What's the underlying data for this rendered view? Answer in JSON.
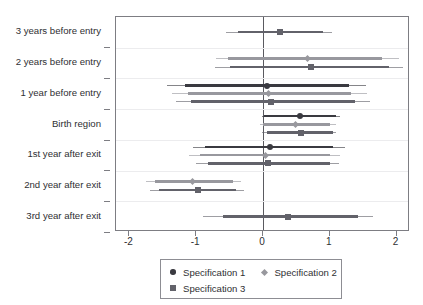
{
  "chart_data": {
    "type": "scatter",
    "subtype": "coefficient-plot-forest",
    "title": "",
    "subtitle": "",
    "xlabel": "",
    "ylabel": "",
    "xlim": [
      -2.2,
      2.2
    ],
    "xticks": [
      -2,
      -1,
      0,
      1,
      2
    ],
    "xticklabels": [
      "-2",
      "-1",
      "0",
      "1",
      "2"
    ],
    "grid": true,
    "grid_axis": "y",
    "zero_reference_line": 0,
    "legend_position": "bottom",
    "categories": [
      "3 years before entry",
      "2 years before entry",
      "1 year before entry",
      "Birth region",
      "1st year after exit",
      "2nd year after exit",
      "3rd year after exit"
    ],
    "series": [
      {
        "name": "Specification 1",
        "marker": "circle",
        "color": "#3a3a40",
        "points": [
          {
            "category": "3 years before entry",
            "estimate": null,
            "ci_low": null,
            "ci_high": null,
            "ci_outer_low": null,
            "ci_outer_high": null
          },
          {
            "category": "2 years before entry",
            "estimate": null,
            "ci_low": null,
            "ci_high": null,
            "ci_outer_low": null,
            "ci_outer_high": null
          },
          {
            "category": "1 year before entry",
            "estimate": 0.06,
            "ci_low": -1.17,
            "ci_high": 1.28,
            "ci_outer_low": -1.43,
            "ci_outer_high": 1.54
          },
          {
            "category": "Birth region",
            "estimate": 0.55,
            "ci_low": 0.02,
            "ci_high": 1.09,
            "ci_outer_low": -0.02,
            "ci_outer_high": 1.15
          },
          {
            "category": "1st year after exit",
            "estimate": 0.1,
            "ci_low": -0.87,
            "ci_high": 1.05,
            "ci_outer_low": -1.05,
            "ci_outer_high": 1.22
          },
          {
            "category": "2nd year after exit",
            "estimate": null,
            "ci_low": null,
            "ci_high": null,
            "ci_outer_low": null,
            "ci_outer_high": null
          },
          {
            "category": "3rd year after exit",
            "estimate": null,
            "ci_low": null,
            "ci_high": null,
            "ci_outer_low": null,
            "ci_outer_high": null
          }
        ]
      },
      {
        "name": "Specification 2",
        "marker": "diamond",
        "color": "#98989e",
        "points": [
          {
            "category": "3 years before entry",
            "estimate": null,
            "ci_low": null,
            "ci_high": null,
            "ci_outer_low": null,
            "ci_outer_high": null
          },
          {
            "category": "2 years before entry",
            "estimate": 0.66,
            "ci_low": -0.52,
            "ci_high": 1.78,
            "ci_outer_low": -0.71,
            "ci_outer_high": 2.04
          },
          {
            "category": "1 year before entry",
            "estimate": 0.08,
            "ci_low": -1.12,
            "ci_high": 1.32,
            "ci_outer_low": -1.36,
            "ci_outer_high": 1.55
          },
          {
            "category": "Birth region",
            "estimate": 0.49,
            "ci_low": 0.0,
            "ci_high": 1.0,
            "ci_outer_low": -0.05,
            "ci_outer_high": 1.09
          },
          {
            "category": "1st year after exit",
            "estimate": 0.04,
            "ci_low": -0.95,
            "ci_high": 1.0,
            "ci_outer_low": -1.11,
            "ci_outer_high": 1.15
          },
          {
            "category": "2nd year after exit",
            "estimate": -1.05,
            "ci_low": -1.62,
            "ci_high": -0.45,
            "ci_outer_low": -1.75,
            "ci_outer_high": -0.33
          },
          {
            "category": "3rd year after exit",
            "estimate": null,
            "ci_low": null,
            "ci_high": null,
            "ci_outer_low": null,
            "ci_outer_high": null
          }
        ]
      },
      {
        "name": "Specification 3",
        "marker": "square",
        "color": "#62626a",
        "points": [
          {
            "category": "3 years before entry",
            "estimate": 0.25,
            "ci_low": -0.37,
            "ci_high": 0.9,
            "ci_outer_low": -0.55,
            "ci_outer_high": 1.04
          },
          {
            "category": "2 years before entry",
            "estimate": 0.72,
            "ci_low": -0.5,
            "ci_high": 1.88,
            "ci_outer_low": -0.72,
            "ci_outer_high": 2.1
          },
          {
            "category": "1 year before entry",
            "estimate": 0.12,
            "ci_low": -1.08,
            "ci_high": 1.38,
            "ci_outer_low": -1.3,
            "ci_outer_high": 1.6
          },
          {
            "category": "Birth region",
            "estimate": 0.57,
            "ci_low": 0.06,
            "ci_high": 1.05,
            "ci_outer_low": -0.02,
            "ci_outer_high": 1.1
          },
          {
            "category": "1st year after exit",
            "estimate": 0.07,
            "ci_low": -0.83,
            "ci_high": 1.0,
            "ci_outer_low": -1.0,
            "ci_outer_high": 1.14
          },
          {
            "category": "2nd year after exit",
            "estimate": -0.98,
            "ci_low": -1.55,
            "ci_high": -0.4,
            "ci_outer_low": -1.69,
            "ci_outer_high": -0.28
          },
          {
            "category": "3rd year after exit",
            "estimate": 0.38,
            "ci_low": -0.6,
            "ci_high": 1.42,
            "ci_outer_low": -0.9,
            "ci_outer_high": 1.65
          }
        ]
      }
    ],
    "legend": [
      "Specification 1",
      "Specification 2",
      "Specification 3"
    ],
    "colors": {
      "spec1": "#3a3a40",
      "spec2": "#98989e",
      "spec3": "#62626a",
      "axis": "#7d7d83",
      "grid": "#ececee",
      "zero_line": "#5a5a60",
      "background": "#ffffff"
    }
  }
}
